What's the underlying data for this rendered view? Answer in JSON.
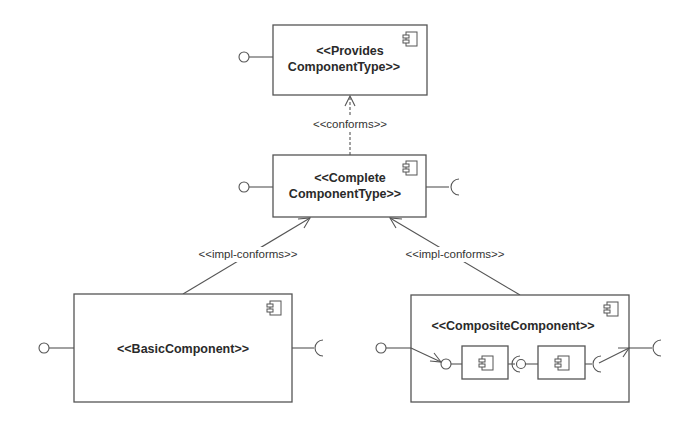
{
  "diagram": {
    "type": "UML component diagram",
    "components": {
      "provides": {
        "line1": "<<Provides",
        "line2": "ComponentType>>"
      },
      "complete": {
        "line1": "<<Complete",
        "line2": "ComponentType>>"
      },
      "basic": {
        "label": "<<BasicComponent>>"
      },
      "composite": {
        "label": "<<CompositeComponent>>"
      }
    },
    "relations": {
      "conforms": "<<conforms>>",
      "impl_left": "<<impl-conforms>>",
      "impl_right": "<<impl-conforms>>"
    },
    "colors": {
      "stroke": "#555555",
      "text": "#2a2a2a",
      "background": "#ffffff"
    }
  }
}
